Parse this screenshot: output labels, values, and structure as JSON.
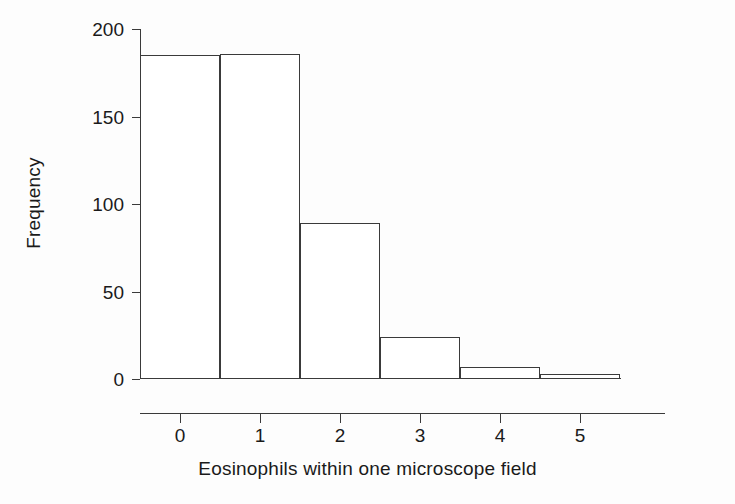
{
  "chart_data": {
    "type": "bar",
    "title": "",
    "subtitle": "",
    "xlabel": "Eosinophils within one microscope field",
    "ylabel": "Frequency",
    "categories": [
      "0",
      "1",
      "2",
      "3",
      "4",
      "5"
    ],
    "values": [
      185,
      186,
      89,
      24,
      7,
      3
    ],
    "series": [
      {
        "name": "Frequency",
        "values": [
          185,
          186,
          89,
          24,
          7,
          3
        ]
      }
    ],
    "xlim": [
      -0.5,
      5.5
    ],
    "ylim": [
      0,
      200
    ],
    "ytick_labels": [
      "0",
      "50",
      "100",
      "150",
      "200"
    ],
    "ytick_values": [
      0,
      50,
      100,
      150,
      200
    ],
    "xtick_labels": [
      "0",
      "1",
      "2",
      "3",
      "4",
      "5"
    ],
    "xtick_values": [
      0,
      1,
      2,
      3,
      4,
      5
    ],
    "grid": false,
    "legend": false,
    "legend_position": "none",
    "bar_style": "histogram-adjacent",
    "bar_fill": "#ffffff",
    "bar_edge_color": "#3a3a3a",
    "axis_color": "#3a3a3a",
    "background": "#fdfdfd",
    "annotations": []
  },
  "figure": {
    "background_color": "#fdfdfd",
    "text_color": "#1a1a1a"
  }
}
